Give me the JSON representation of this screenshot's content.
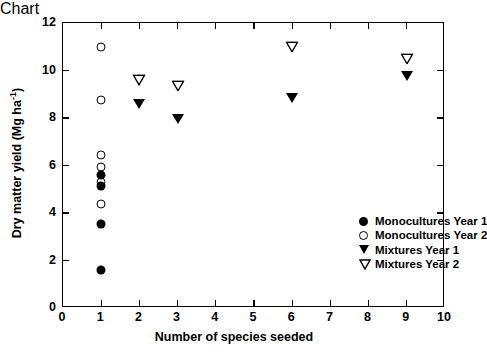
{
  "chart_data": {
    "type": "scatter",
    "title": "",
    "xlabel": "Number of species seeded",
    "ylabel": "Dry matter yield (Mg ha",
    "ylabel_sup": "-1",
    "ylabel_tail": ")",
    "xlim": [
      0,
      10
    ],
    "ylim": [
      0,
      12
    ],
    "xticks": [
      "0",
      "1",
      "2",
      "3",
      "4",
      "5",
      "6",
      "7",
      "8",
      "9",
      "10"
    ],
    "xtick_values": [
      0,
      1,
      2,
      3,
      4,
      5,
      6,
      7,
      8,
      9,
      10
    ],
    "yticks": [
      "0",
      "2",
      "4",
      "6",
      "8",
      "10",
      "12"
    ],
    "ytick_values": [
      0,
      2,
      4,
      6,
      8,
      10,
      12
    ],
    "grid": false,
    "legend_position": "inside-lower-right",
    "series": [
      {
        "name": "Monocultures Year 1",
        "marker": "filled-circle",
        "color": "#000000",
        "points": [
          {
            "x": 1,
            "y": 5.6
          },
          {
            "x": 1,
            "y": 5.15
          },
          {
            "x": 1,
            "y": 3.55
          },
          {
            "x": 1,
            "y": 1.6
          }
        ]
      },
      {
        "name": "Monocultures Year 2",
        "marker": "open-circle",
        "color": "#000000",
        "points": [
          {
            "x": 1,
            "y": 11.0
          },
          {
            "x": 1,
            "y": 8.75
          },
          {
            "x": 1,
            "y": 6.45
          },
          {
            "x": 1,
            "y": 5.95
          },
          {
            "x": 1,
            "y": 5.3
          },
          {
            "x": 1,
            "y": 4.4
          }
        ]
      },
      {
        "name": "Mixtures Year 1",
        "marker": "filled-triangle-down",
        "color": "#000000",
        "points": [
          {
            "x": 2,
            "y": 8.6
          },
          {
            "x": 3,
            "y": 7.95
          },
          {
            "x": 6,
            "y": 8.85
          },
          {
            "x": 9,
            "y": 9.75
          }
        ]
      },
      {
        "name": "Mixtures Year 2",
        "marker": "open-triangle-down",
        "color": "#000000",
        "points": [
          {
            "x": 2,
            "y": 9.6
          },
          {
            "x": 3,
            "y": 9.35
          },
          {
            "x": 6,
            "y": 11.0
          },
          {
            "x": 9,
            "y": 10.5
          }
        ]
      }
    ]
  },
  "legend": {
    "entries": [
      {
        "label": "Monocultures Year 1",
        "marker": "filled-circle"
      },
      {
        "label": "Monocultures Year 2",
        "marker": "open-circle"
      },
      {
        "label": "Mixtures Year 1",
        "marker": "filled-triangle-down"
      },
      {
        "label": "Mixtures Year 2",
        "marker": "open-triangle-down"
      }
    ]
  }
}
